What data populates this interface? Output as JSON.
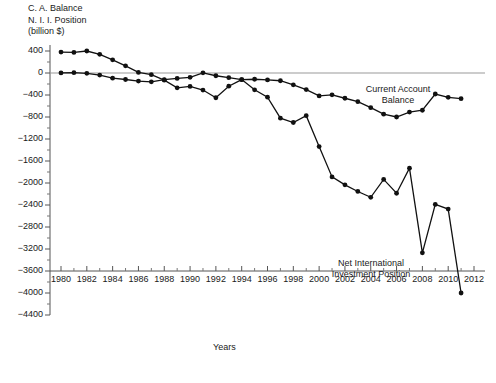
{
  "header": {
    "title_lines": "C. A. Balance\nN. I. I. Position\n(billion $)"
  },
  "labels": {
    "current_account": "Current Account\nBalance",
    "niip": "Net International\nInvestment\nPosition",
    "xaxis": "Years"
  },
  "chart_data": {
    "type": "line",
    "xlabel": "Years",
    "ylabel": "billion $",
    "xlim": [
      1979.2,
      2012.4
    ],
    "ylim": [
      -4400,
      400
    ],
    "ytick_step": 400,
    "minor_ticks": true,
    "grid": false,
    "zero_line": true,
    "legend": "inline-annotations",
    "ytick_labels": [
      "400",
      "0",
      "−400",
      "−800",
      "−1200",
      "−1600",
      "−2000",
      "−2400",
      "−2800",
      "−3200",
      "−3600",
      "−4000",
      "−4400"
    ],
    "ytick_values": [
      400,
      0,
      -400,
      -800,
      -1200,
      -1600,
      -2000,
      -2400,
      -2800,
      -3200,
      -3600,
      -4000,
      -4400
    ],
    "xtick_labels": [
      "1980",
      "1982",
      "1984",
      "1986",
      "1988",
      "1990",
      "1992",
      "1994",
      "1996",
      "1998",
      "2000",
      "2002",
      "2004",
      "2006",
      "2008",
      "2010",
      "2012"
    ],
    "xtick_values": [
      1980,
      1982,
      1984,
      1986,
      1988,
      1990,
      1992,
      1994,
      1996,
      1998,
      2000,
      2002,
      2004,
      2006,
      2008,
      2010,
      2012
    ],
    "x": [
      1980,
      1981,
      1982,
      1983,
      1984,
      1985,
      1986,
      1987,
      1988,
      1989,
      1990,
      1991,
      1992,
      1993,
      1994,
      1995,
      1996,
      1997,
      1998,
      1999,
      2000,
      2001,
      2002,
      2003,
      2004,
      2005,
      2006,
      2007,
      2008,
      2009,
      2010,
      2011
    ],
    "series": [
      {
        "name": "Current Account Balance",
        "marker": "filled-circle",
        "color": "#111111",
        "values": [
          2,
          5,
          -5,
          -38,
          -94,
          -118,
          -147,
          -160,
          -121,
          -99,
          -79,
          3,
          -50,
          -85,
          -122,
          -114,
          -125,
          -141,
          -215,
          -301,
          -416,
          -397,
          -459,
          -522,
          -631,
          -749,
          -800,
          -711,
          -677,
          -382,
          -442,
          -466
        ]
      },
      {
        "name": "Net International Investment Position",
        "marker": "filled-circle",
        "color": "#111111",
        "values": [
          380,
          375,
          400,
          340,
          240,
          130,
          10,
          -30,
          -130,
          -270,
          -245,
          -310,
          -450,
          -240,
          -120,
          -305,
          -440,
          -822,
          -900,
          -775,
          -1337,
          -1889,
          -2034,
          -2154,
          -2260,
          -1935,
          -2186,
          -1730,
          -3270,
          -2390,
          -2474,
          -4000
        ]
      }
    ]
  }
}
